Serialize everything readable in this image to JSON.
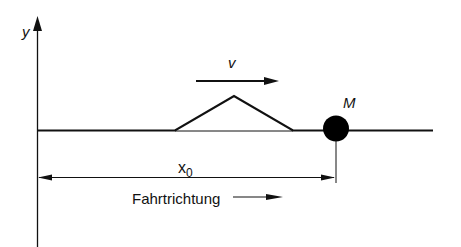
{
  "diagram": {
    "type": "physics-sketch",
    "colors": {
      "stroke": "#111111",
      "background": "#ffffff"
    },
    "axis": {
      "label": "y"
    },
    "velocity": {
      "label": "v"
    },
    "mass": {
      "label": "M"
    },
    "dimension": {
      "label_main": "x",
      "label_sub": "0"
    },
    "direction": {
      "label": "Fahrtrichtung"
    }
  }
}
